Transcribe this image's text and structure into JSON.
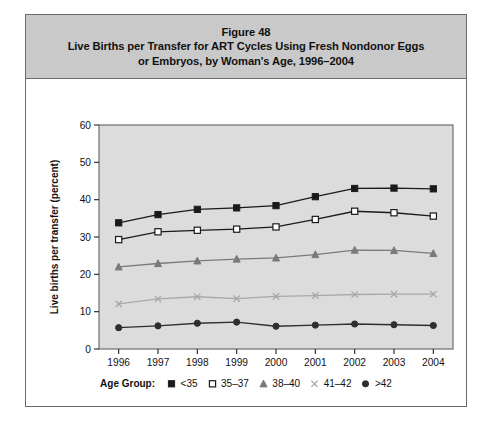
{
  "figure": {
    "number": "Figure 48",
    "title_line1": "Live Births per Transfer for ART Cycles Using Fresh Nondonor Eggs",
    "title_line2": "or Embryos, by Woman's Age, 1996–2004",
    "header_bg": "#c9c9c9",
    "frame_border": "#6b6b6b"
  },
  "legend": {
    "title": "Age Group:",
    "entries": [
      {
        "label": "<35",
        "marker": "filled-square",
        "color": "#1a1a1a"
      },
      {
        "label": "35–37",
        "marker": "open-square",
        "color": "#1a1a1a"
      },
      {
        "label": "38–40",
        "marker": "filled-triangle",
        "color": "#7a7a7a"
      },
      {
        "label": "41–42",
        "marker": "cross-x",
        "color": "#a8a8a8"
      },
      {
        "label": ">42",
        "marker": "filled-circle",
        "color": "#2e2e2e"
      }
    ]
  },
  "chart_data": {
    "type": "line",
    "title": "Live Births per Transfer for ART Cycles Using Fresh Nondonor Eggs or Embryos, by Woman's Age, 1996–2004",
    "xlabel": "Year",
    "ylabel": "Live births per transfer (percent)",
    "categories": [
      "1996",
      "1997",
      "1998",
      "1999",
      "2000",
      "2001",
      "2002",
      "2003",
      "2004"
    ],
    "x": [
      1996,
      1997,
      1998,
      1999,
      2000,
      2001,
      2002,
      2003,
      2004
    ],
    "ylim": [
      0,
      60
    ],
    "yticks": [
      0,
      10,
      20,
      30,
      40,
      50,
      60
    ],
    "grid": false,
    "legend_position": "bottom",
    "plot_background": "#dcdcdc",
    "series": [
      {
        "name": "<35",
        "marker": "filled-square",
        "color": "#1a1a1a",
        "values": [
          33.8,
          36.0,
          37.4,
          37.8,
          38.4,
          40.8,
          43.0,
          43.1,
          42.9
        ]
      },
      {
        "name": "35–37",
        "marker": "open-square",
        "color": "#1a1a1a",
        "values": [
          29.3,
          31.4,
          31.8,
          32.1,
          32.7,
          34.7,
          36.9,
          36.5,
          35.6
        ]
      },
      {
        "name": "38–40",
        "marker": "filled-triangle",
        "color": "#7a7a7a",
        "values": [
          22.0,
          22.9,
          23.6,
          24.1,
          24.4,
          25.3,
          26.5,
          26.4,
          25.6
        ]
      },
      {
        "name": "41–42",
        "marker": "cross-x",
        "color": "#a8a8a8",
        "values": [
          12.1,
          13.4,
          14.0,
          13.5,
          14.1,
          14.3,
          14.6,
          14.7,
          14.7
        ]
      },
      {
        "name": ">42",
        "marker": "filled-circle",
        "color": "#2e2e2e",
        "values": [
          5.7,
          6.2,
          6.9,
          7.2,
          6.1,
          6.4,
          6.7,
          6.5,
          6.3
        ]
      }
    ]
  }
}
